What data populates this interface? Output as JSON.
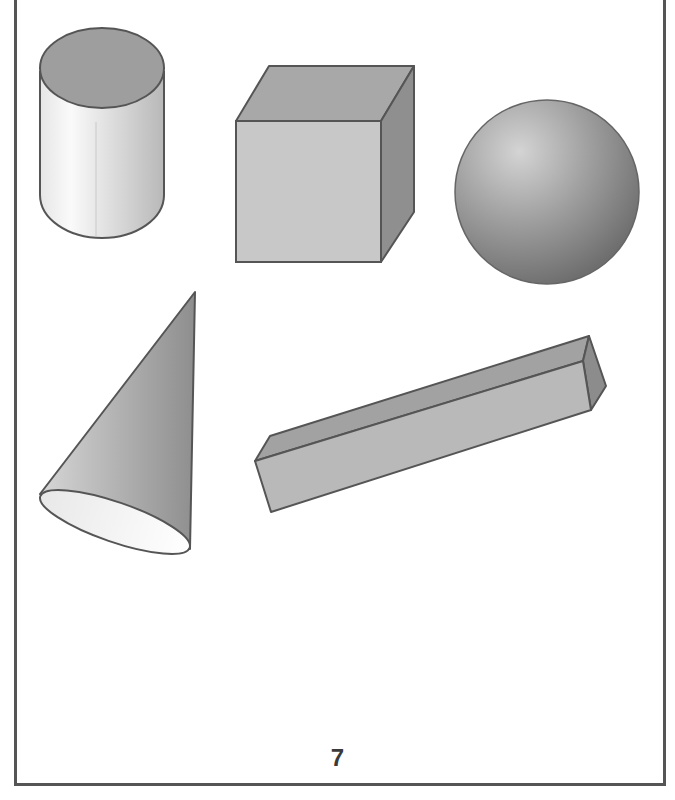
{
  "page": {
    "number": "7",
    "shapes": [
      {
        "name": "cylinder"
      },
      {
        "name": "cube"
      },
      {
        "name": "sphere"
      },
      {
        "name": "cone"
      },
      {
        "name": "rectangular-prism"
      }
    ]
  },
  "colors": {
    "outline": "#555555",
    "face_light": "#d2d2d2",
    "face_mid": "#b4b4b4",
    "face_dark": "#9a9a9a"
  }
}
